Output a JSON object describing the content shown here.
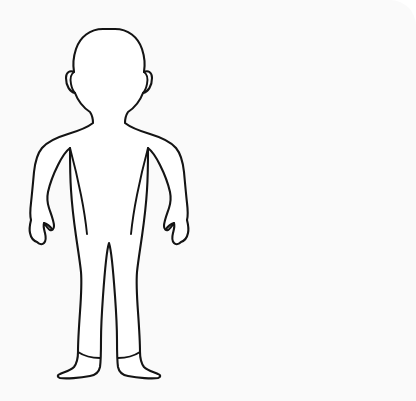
{
  "canvas": {
    "width": 416,
    "height": 401,
    "background_color": "#fafafa",
    "page_background_color": "#ffffff",
    "corner_radius_top_right": 26,
    "label": "drawing-canvas"
  },
  "artwork": {
    "title": "Human Body Outline",
    "type": "line-art-silhouette",
    "subject": "human-figure-front-view",
    "stroke_color": "#141414",
    "fill_color": "#ffffff",
    "stroke_width": 2.1,
    "bounds": {
      "left": 30,
      "top": 29,
      "right": 176,
      "bottom": 376
    },
    "parts": [
      {
        "name": "head",
        "label": "Head"
      },
      {
        "name": "left-ear",
        "label": "Left Ear"
      },
      {
        "name": "right-ear",
        "label": "Right Ear"
      },
      {
        "name": "neck",
        "label": "Neck"
      },
      {
        "name": "left-shoulder",
        "label": "Left Shoulder"
      },
      {
        "name": "right-shoulder",
        "label": "Right Shoulder"
      },
      {
        "name": "torso",
        "label": "Torso"
      },
      {
        "name": "left-arm",
        "label": "Left Arm"
      },
      {
        "name": "right-arm",
        "label": "Right Arm"
      },
      {
        "name": "left-hand",
        "label": "Left Hand"
      },
      {
        "name": "right-hand",
        "label": "Right Hand"
      },
      {
        "name": "left-leg",
        "label": "Left Leg"
      },
      {
        "name": "right-leg",
        "label": "Right Leg"
      },
      {
        "name": "left-foot",
        "label": "Left Foot"
      },
      {
        "name": "right-foot",
        "label": "Right Foot"
      }
    ]
  }
}
